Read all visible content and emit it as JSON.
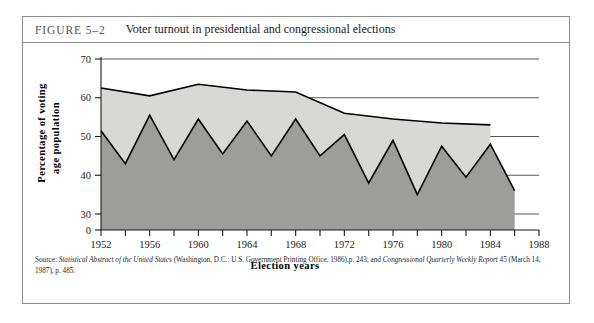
{
  "figure": {
    "label": "FIGURE 5–2",
    "title": "Voter turnout in presidential and congressional elections"
  },
  "source": {
    "lead": "Source: ",
    "part1_italic": "Statistical Abstract of the United States",
    "part2": " (Washington, D.C.: U.S. Government Printing Office, 1986),p. 243; and ",
    "part3_italic": "Congressional Quarterly Weekly Report",
    "part4": " 45 (March 14, 1987), p. 485."
  },
  "colors": {
    "presidential_fill": "#d8d8d6",
    "congressional_fill": "#9d9d9b",
    "line": "#000000",
    "grid": "#45433f",
    "frame": "#8e8e90",
    "caption_label": "#55534f"
  },
  "chart_data": {
    "type": "area",
    "title": "Voter turnout in presidential and congressional elections",
    "xlabel": "Election years",
    "ylabel": "Percentage of voting age population",
    "xlim": [
      1952,
      1988
    ],
    "ylim": [
      0,
      70
    ],
    "y_axis_break": true,
    "y_ticks": [
      0,
      30,
      40,
      50,
      60,
      70
    ],
    "x_ticks": [
      1952,
      1954,
      1956,
      1958,
      1960,
      1962,
      1964,
      1966,
      1968,
      1970,
      1972,
      1974,
      1976,
      1978,
      1980,
      1982,
      1984,
      1986,
      1988
    ],
    "x_tick_labels": [
      1952,
      1956,
      1960,
      1964,
      1968,
      1972,
      1976,
      1980,
      1984,
      1988
    ],
    "grid": true,
    "legend_position": "none",
    "series": [
      {
        "name": "Presidential elections",
        "fill": "#d8d8d6",
        "x": [
          1952,
          1956,
          1960,
          1964,
          1968,
          1972,
          1976,
          1980,
          1984
        ],
        "values": [
          62.5,
          60.5,
          63.5,
          62.0,
          61.5,
          56.0,
          54.5,
          53.5,
          53.0
        ]
      },
      {
        "name": "Congressional elections",
        "fill": "#9d9d9b",
        "x": [
          1952,
          1954,
          1956,
          1958,
          1960,
          1962,
          1964,
          1966,
          1968,
          1970,
          1972,
          1974,
          1976,
          1978,
          1980,
          1982,
          1984,
          1986
        ],
        "values": [
          51.5,
          43.0,
          55.5,
          44.0,
          54.5,
          45.5,
          54.0,
          45.0,
          54.5,
          45.0,
          50.5,
          38.0,
          49.0,
          35.0,
          47.5,
          39.5,
          48.0,
          36.0
        ]
      }
    ]
  }
}
